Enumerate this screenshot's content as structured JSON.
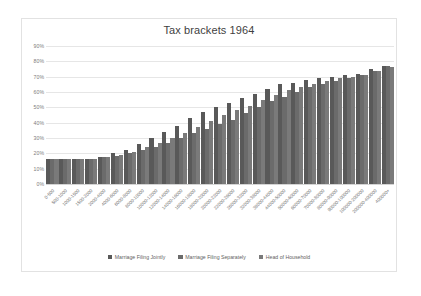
{
  "chart_data": {
    "type": "bar",
    "title": "Tax brackets 1964",
    "xlabel": "",
    "ylabel": "",
    "ylim": [
      0,
      90
    ],
    "ytick_labels": [
      "90%",
      "80%",
      "70%",
      "60%",
      "50%",
      "40%",
      "30%",
      "20%",
      "10%",
      "0%"
    ],
    "ytick_values": [
      90,
      80,
      70,
      60,
      50,
      40,
      30,
      20,
      10,
      0
    ],
    "grid": true,
    "legend_position": "bottom",
    "bar_color": "#595959",
    "categories": [
      "0-500",
      "500-1000",
      "1000-1500",
      "1500-2000",
      "2000-4000",
      "4000-6000",
      "6000-8000",
      "8000-10000",
      "10000-12000",
      "12000-14000",
      "14000-16000",
      "16000-18000",
      "18000-20000",
      "20000-22000",
      "22000-26000",
      "26000-32000",
      "32000-38000",
      "38000-44000",
      "44000-50000",
      "50000-60000",
      "60000-70000",
      "70000-80000",
      "80000-90000",
      "90000-100000",
      "100000-200000",
      "200000-400000",
      "400000+"
    ],
    "series": [
      {
        "name": "Marriage Filing Jointly",
        "color": "#595959",
        "values": [
          16,
          16,
          16.5,
          16.5,
          17.5,
          20,
          22,
          26,
          30,
          34,
          38,
          43,
          47,
          50,
          53,
          56,
          59,
          62,
          65,
          66,
          68,
          69,
          70,
          71,
          72,
          75,
          77
        ]
      },
      {
        "name": "Marriage Filing Separately",
        "color": "#6b6b6b",
        "values": [
          16,
          16,
          16.5,
          16.5,
          17.5,
          18.5,
          20,
          22,
          24,
          27,
          30,
          33,
          36,
          39,
          42,
          46,
          50,
          54,
          57,
          60,
          63,
          65,
          67,
          69,
          71,
          74,
          77
        ]
      },
      {
        "name": "Head of Household",
        "color": "#7a7a7a",
        "values": [
          16,
          16,
          16.5,
          16.5,
          17.5,
          19,
          21,
          24,
          27,
          30,
          33,
          37,
          41,
          45,
          48,
          51,
          55,
          58,
          61,
          63,
          65,
          67,
          69,
          70,
          71,
          74,
          76
        ]
      }
    ]
  },
  "legend": {
    "items": [
      {
        "label": "Marriage Filing Jointly"
      },
      {
        "label": "Marriage Filing Separately"
      },
      {
        "label": "Head of Household"
      }
    ]
  }
}
